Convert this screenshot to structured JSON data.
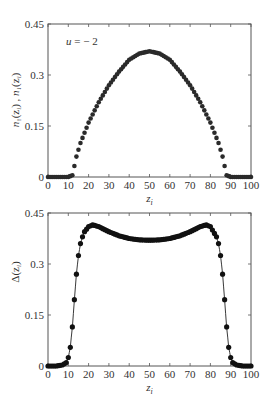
{
  "chart_data": [
    {
      "type": "scatter",
      "title": "",
      "annotation": "u = −2",
      "annotation_parts": {
        "var": "u",
        "op": " = ",
        "val": "− 2"
      },
      "xlabel": "z_i",
      "xlabel_parts": {
        "base": "z",
        "sub": "i"
      },
      "ylabel": "n↑(z_i) , n↓(z_i)",
      "ylabel_parts": {
        "a": "n",
        "a_sub": "↑",
        "b": "n",
        "b_sub": "↓",
        "arg": "(z",
        "arg_sub": "i",
        "close": ")",
        "sep": " , "
      },
      "xlim": [
        0,
        100
      ],
      "ylim": [
        0,
        0.45
      ],
      "xticks": [
        "0",
        "10",
        "20",
        "30",
        "40",
        "50",
        "60",
        "70",
        "80",
        "90",
        "100"
      ],
      "yticks": [
        "0",
        "0.15",
        "0.3",
        "0.45"
      ],
      "grid": false,
      "legend": null,
      "marker": "dot",
      "description": "Two overlapping spin densities (identical), zero for z<12 and z>88, dome shaped with peak ≈0.37 at z=50",
      "series": [
        {
          "name": "n_up",
          "x": [
            0,
            5,
            10,
            12,
            14,
            16,
            18,
            20,
            25,
            30,
            35,
            40,
            45,
            50,
            55,
            60,
            65,
            70,
            75,
            80,
            82,
            84,
            86,
            88,
            90,
            95,
            100
          ],
          "values": [
            0,
            0,
            0,
            0.005,
            0.06,
            0.1,
            0.13,
            0.16,
            0.22,
            0.27,
            0.31,
            0.345,
            0.363,
            0.37,
            0.363,
            0.345,
            0.31,
            0.27,
            0.22,
            0.16,
            0.13,
            0.1,
            0.06,
            0.005,
            0,
            0,
            0
          ]
        },
        {
          "name": "n_down",
          "x": [
            0,
            5,
            10,
            12,
            14,
            16,
            18,
            20,
            25,
            30,
            35,
            40,
            45,
            50,
            55,
            60,
            65,
            70,
            75,
            80,
            82,
            84,
            86,
            88,
            90,
            95,
            100
          ],
          "values": [
            0,
            0,
            0,
            0.005,
            0.06,
            0.1,
            0.13,
            0.16,
            0.22,
            0.27,
            0.31,
            0.345,
            0.363,
            0.37,
            0.363,
            0.345,
            0.31,
            0.27,
            0.22,
            0.16,
            0.13,
            0.1,
            0.06,
            0.005,
            0,
            0,
            0
          ]
        }
      ]
    },
    {
      "type": "line",
      "title": "",
      "xlabel": "z_i",
      "xlabel_parts": {
        "base": "z",
        "sub": "i"
      },
      "ylabel": "Δ(z_i)",
      "ylabel_parts": {
        "a": "Δ(z",
        "sub": "i",
        "close": ")"
      },
      "xlim": [
        0,
        100
      ],
      "ylim": [
        0,
        0.45
      ],
      "xticks": [
        "0",
        "10",
        "20",
        "30",
        "40",
        "50",
        "60",
        "70",
        "80",
        "90",
        "100"
      ],
      "yticks": [
        "0",
        "0.15",
        "0.3",
        "0.45"
      ],
      "grid": false,
      "legend": null,
      "marker": "dot-with-line",
      "description": "Pairing amplitude; zero near edges, sharp rise 8–20, peaks ≈0.415 at z≈22 and z≈78, dip ≈0.37 at z=50",
      "series": [
        {
          "name": "Delta",
          "x": [
            0,
            4,
            7,
            9,
            10,
            11,
            12,
            13,
            14,
            15,
            16,
            17,
            18,
            20,
            22,
            25,
            30,
            35,
            40,
            45,
            50,
            55,
            60,
            65,
            70,
            75,
            78,
            80,
            83,
            84,
            85,
            86,
            87,
            88,
            89,
            90,
            91,
            93,
            96,
            100
          ],
          "values": [
            0,
            0,
            0.003,
            0.01,
            0.025,
            0.055,
            0.115,
            0.195,
            0.27,
            0.325,
            0.36,
            0.38,
            0.395,
            0.41,
            0.415,
            0.41,
            0.395,
            0.383,
            0.375,
            0.371,
            0.37,
            0.371,
            0.375,
            0.383,
            0.395,
            0.41,
            0.415,
            0.41,
            0.38,
            0.36,
            0.325,
            0.27,
            0.195,
            0.115,
            0.055,
            0.025,
            0.01,
            0.003,
            0,
            0
          ]
        }
      ]
    }
  ]
}
